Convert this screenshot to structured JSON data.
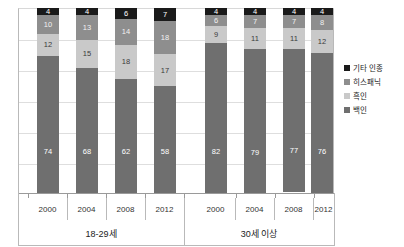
{
  "chart_data": {
    "type": "bar",
    "title": "",
    "subtitle": "",
    "xlabel": "",
    "ylabel": "",
    "ylim": [
      0,
      100
    ],
    "grid": true,
    "stacked": true,
    "stack_total": 100,
    "legend_position": "right",
    "categories": [
      "2000",
      "2004",
      "2008",
      "2012",
      "2000",
      "2004",
      "2008",
      "2012"
    ],
    "groups": [
      {
        "label": "18-29세",
        "categories": [
          "2000",
          "2004",
          "2008",
          "2012"
        ]
      },
      {
        "label": "30세 이상",
        "categories": [
          "2000",
          "2004",
          "2008",
          "2012"
        ]
      }
    ],
    "series": [
      {
        "name": "기타 인종",
        "color": "#1a1a1a",
        "values": [
          4,
          4,
          6,
          7,
          4,
          4,
          4,
          4
        ]
      },
      {
        "name": "히스패닉",
        "color": "#8e8e8e",
        "values": [
          10,
          13,
          14,
          18,
          6,
          7,
          7,
          8
        ]
      },
      {
        "name": "흑인",
        "color": "#c9c9c9",
        "values": [
          12,
          15,
          18,
          17,
          9,
          11,
          11,
          12
        ]
      },
      {
        "name": "백인",
        "color": "#6f6f6f",
        "values": [
          74,
          68,
          62,
          58,
          82,
          79,
          77,
          76
        ]
      }
    ],
    "bars": [
      {
        "group": "18-29세",
        "year": "2000",
        "other": 4,
        "hispanic": 10,
        "black": 12,
        "white": 74
      },
      {
        "group": "18-29세",
        "year": "2004",
        "other": 4,
        "hispanic": 13,
        "black": 15,
        "white": 68
      },
      {
        "group": "18-29세",
        "year": "2008",
        "other": 6,
        "hispanic": 14,
        "black": 18,
        "white": 62
      },
      {
        "group": "18-29세",
        "year": "2012",
        "other": 7,
        "hispanic": 18,
        "black": 17,
        "white": 58
      },
      {
        "group": "30세 이상",
        "year": "2000",
        "other": 4,
        "hispanic": 6,
        "black": 9,
        "white": 82
      },
      {
        "group": "30세 이상",
        "year": "2004",
        "other": 4,
        "hispanic": 7,
        "black": 11,
        "white": 79
      },
      {
        "group": "30세 이상",
        "year": "2008",
        "other": 4,
        "hispanic": 7,
        "black": 11,
        "white": 77
      },
      {
        "group": "30세 이상",
        "year": "2012",
        "other": 4,
        "hispanic": 8,
        "black": 12,
        "white": 76
      }
    ]
  },
  "legend": {
    "items": [
      {
        "label": "기타 인종",
        "color": "#1a1a1a"
      },
      {
        "label": "히스패닉",
        "color": "#8e8e8e"
      },
      {
        "label": "흑인",
        "color": "#c9c9c9"
      },
      {
        "label": "백인",
        "color": "#6f6f6f"
      }
    ]
  },
  "axis": {
    "years": [
      "2000",
      "2004",
      "2008",
      "2012",
      "2000",
      "2004",
      "2008",
      "2012"
    ],
    "groups": [
      "18-29세",
      "30세 이상"
    ]
  }
}
